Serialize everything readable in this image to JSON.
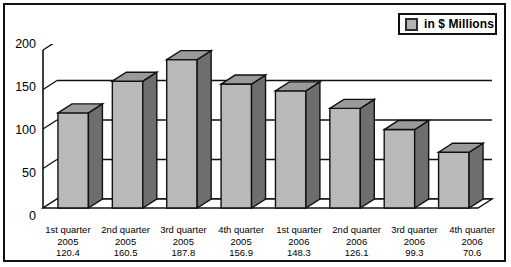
{
  "legend": {
    "label": "in $ Millions",
    "swatch_color": "#b4b4b4",
    "swatch_icon": "legend-square-icon"
  },
  "axis": {
    "yticks": [
      "200",
      "150",
      "100",
      "50",
      "0"
    ]
  },
  "chart_data": {
    "type": "bar",
    "title": "",
    "xlabel": "",
    "ylabel": "",
    "ylim": [
      0,
      200
    ],
    "yticks": [
      0,
      50,
      100,
      150,
      200
    ],
    "grid": true,
    "legend_position": "top-right",
    "style": "3d-column",
    "categories": [
      "1st quarter 2005",
      "2nd quarter 2005",
      "3rd quarter 2005",
      "4th quarter 2005",
      "1st quarter 2006",
      "2nd quarter 2006",
      "3rd quarter 2006",
      "4th quarter 2006"
    ],
    "series": [
      {
        "name": "in $ Millions",
        "values": [
          120.4,
          160.5,
          187.8,
          156.9,
          148.3,
          126.1,
          99.3,
          70.6
        ]
      }
    ]
  },
  "xlabels": [
    {
      "quarter": "1st quarter",
      "year": "2005",
      "value": "120.4"
    },
    {
      "quarter": "2nd quarter",
      "year": "2005",
      "value": "160.5"
    },
    {
      "quarter": "3rd quarter",
      "year": "2005",
      "value": "187.8"
    },
    {
      "quarter": "4th quarter",
      "year": "2005",
      "value": "156.9"
    },
    {
      "quarter": "1st quarter",
      "year": "2006",
      "value": "148.3"
    },
    {
      "quarter": "2nd quarter",
      "year": "2006",
      "value": "126.1"
    },
    {
      "quarter": "3rd quarter",
      "year": "2006",
      "value": "99.3"
    },
    {
      "quarter": "4th quarter",
      "year": "2006",
      "value": "70.6"
    }
  ],
  "colors": {
    "bar_front": "#b9b9b9",
    "bar_side": "#6e6e6e",
    "bar_top": "#9a9a9a",
    "outline": "#111111",
    "frame": "#111111",
    "background": "#ffffff"
  }
}
